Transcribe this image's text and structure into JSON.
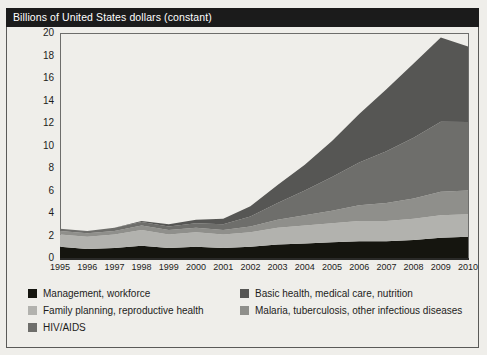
{
  "title": "Billions of United States dollars (constant)",
  "axis": {
    "y_ticks": [
      "20",
      "18",
      "16",
      "14",
      "12",
      "10",
      "8",
      "6",
      "4",
      "2",
      "0"
    ],
    "x_ticks": [
      "1995",
      "1996",
      "1997",
      "1998",
      "1999",
      "2000",
      "2001",
      "2002",
      "2003",
      "2004",
      "2005",
      "2006",
      "2007",
      "2008",
      "2009",
      "2010"
    ]
  },
  "legend": [
    {
      "label": "Management, workforce",
      "color": "#15150f"
    },
    {
      "label": "Basic health, medical care, nutrition",
      "color": "#565654"
    },
    {
      "label": "Family planning, reproductive health",
      "color": "#b2b2ae"
    },
    {
      "label": "Malaria, tuberculosis, other infectious diseases",
      "color": "#8f8f8b"
    },
    {
      "label": "HIV/AIDS",
      "color": "#6e6e6b"
    }
  ],
  "colors": {
    "management": "#15150f",
    "family_planning": "#b2b2ae",
    "malaria_tb": "#8f8f8b",
    "hiv_aids": "#6e6e6b",
    "basic_health": "#565654",
    "title_bar_bg": "#1b1b1b",
    "title_bar_text": "#ffffff",
    "page_bg": "#efeeea",
    "frame": "#5a5a58"
  },
  "chart_data": {
    "type": "area",
    "title": "Billions of United States dollars (constant)",
    "xlabel": "",
    "ylabel": "Billions of United States dollars (constant)",
    "ylim": [
      0,
      20
    ],
    "ytick_step": 2,
    "grid": false,
    "legend_position": "bottom",
    "stacked": true,
    "stack_order_bottom_to_top": [
      "Management, workforce",
      "Family planning, reproductive health",
      "Malaria, tuberculosis, other infectious diseases",
      "HIV/AIDS",
      "Basic health, medical care, nutrition"
    ],
    "x": [
      "1995",
      "1996",
      "1997",
      "1998",
      "1999",
      "2000",
      "2001",
      "2002",
      "2003",
      "2004",
      "2005",
      "2006",
      "2007",
      "2008",
      "2009",
      "2010"
    ],
    "series": [
      {
        "name": "Management, workforce",
        "color": "#15150f",
        "values": [
          1.0,
          0.8,
          0.9,
          1.1,
          0.9,
          1.0,
          0.9,
          1.0,
          1.2,
          1.3,
          1.4,
          1.5,
          1.5,
          1.6,
          1.8,
          1.9
        ]
      },
      {
        "name": "Family planning, reproductive health",
        "color": "#b2b2ae",
        "values": [
          1.1,
          1.1,
          1.2,
          1.4,
          1.2,
          1.3,
          1.2,
          1.3,
          1.5,
          1.6,
          1.7,
          1.8,
          1.8,
          1.9,
          2.0,
          2.0
        ]
      },
      {
        "name": "Malaria, tuberculosis, other infectious diseases",
        "color": "#8f8f8b",
        "values": [
          0.3,
          0.3,
          0.3,
          0.4,
          0.4,
          0.4,
          0.4,
          0.5,
          0.7,
          0.9,
          1.1,
          1.4,
          1.6,
          1.8,
          2.1,
          2.1
        ]
      },
      {
        "name": "HIV/AIDS",
        "color": "#6e6e6b",
        "values": [
          0.2,
          0.2,
          0.3,
          0.3,
          0.3,
          0.4,
          0.5,
          0.9,
          1.5,
          2.2,
          3.0,
          3.8,
          4.6,
          5.4,
          6.2,
          6.1
        ]
      },
      {
        "name": "Basic health, medical care, nutrition",
        "color": "#565654",
        "values": [
          0.0,
          0.0,
          0.0,
          0.1,
          0.2,
          0.3,
          0.5,
          0.9,
          1.6,
          2.3,
          3.2,
          4.3,
          5.5,
          6.6,
          7.5,
          6.7
        ]
      }
    ],
    "totals": [
      2.6,
      2.4,
      2.7,
      3.3,
      3.0,
      3.4,
      3.5,
      4.6,
      6.5,
      8.3,
      10.4,
      12.8,
      15.0,
      17.3,
      19.6,
      18.8
    ],
    "annotations": []
  }
}
